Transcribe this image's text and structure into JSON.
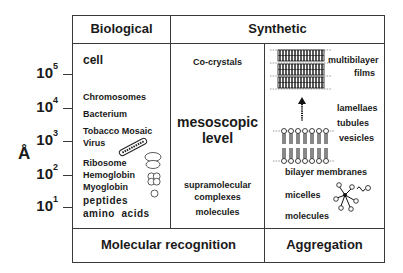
{
  "headers": {
    "biological": "Biological",
    "synthetic": "Synthetic"
  },
  "footers": {
    "molecular_recognition": "Molecular recognition",
    "aggregation": "Aggregation"
  },
  "axis": {
    "unit": "Å",
    "ticks": [
      {
        "base": "10",
        "exp": "5"
      },
      {
        "base": "10",
        "exp": "4"
      },
      {
        "base": "10",
        "exp": "3"
      },
      {
        "base": "10",
        "exp": "2"
      },
      {
        "base": "10",
        "exp": "1"
      }
    ]
  },
  "biological": {
    "items": [
      "cell",
      "Chromosomes",
      "Bacterium",
      "Tobacco Mosaic",
      "Virus",
      "Ribosome",
      "Hemoglobin",
      "Myoglobin",
      "peptides",
      "amino  acids"
    ]
  },
  "synthetic_middle": {
    "top": "Co-crystals",
    "center_line1": "mesoscopic",
    "center_line2": "level",
    "bottom1": "supramolecular",
    "bottom2": "complexes",
    "bottom3": "molecules"
  },
  "synthetic_right": {
    "items": [
      "multibilayer",
      "films",
      "lamellaes",
      "tubules",
      "vesicles",
      "bilayer membranes",
      "micelles",
      "molecules"
    ]
  },
  "icons": [
    "tobacco-mosaic-virus-rod-icon",
    "ribosome-icon",
    "hemoglobin-icon",
    "myoglobin-icon",
    "multibilayer-film-icon",
    "arrow-up-icon",
    "bilayer-vesicle-icon",
    "micelle-icon"
  ]
}
